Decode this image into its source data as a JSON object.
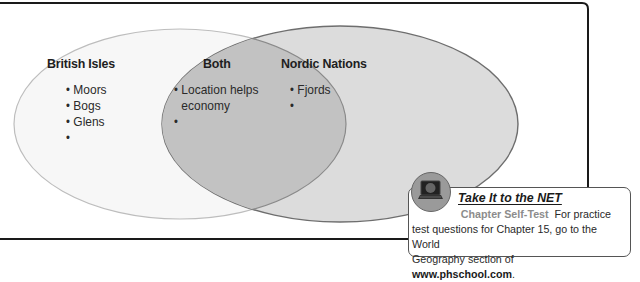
{
  "diagram": {
    "type": "venn",
    "circles": [
      {
        "id": "left",
        "heading": "British Isles",
        "items": [
          "Moors",
          "Bogs",
          "Glens",
          ""
        ],
        "fill": "#f7f7f7",
        "stroke": "#b8b8b8"
      },
      {
        "id": "right",
        "heading": "Nordic Nations",
        "items": [
          "Fjords",
          ""
        ],
        "fill": "#dcdcdc",
        "stroke": "#6e6e6e"
      }
    ],
    "overlap": {
      "heading": "Both",
      "items": [
        "Location helps economy",
        ""
      ],
      "item_lines": [
        "Location helps",
        "economy"
      ],
      "fill": "#c4c4c4"
    }
  },
  "net_callout": {
    "title": "Take It to the NET",
    "subtitle": "Chapter Self-Test",
    "text_line1": "For practice",
    "text_line2": "test questions for Chapter 15, go to the World",
    "text_line3_prefix": "Geography section of ",
    "url": "www.phschool.com",
    "text_line3_suffix": ".",
    "icon": "computer-monitor-icon"
  },
  "colors": {
    "frame": "#1a1a1a",
    "net_subtitle": "#8c8c8c"
  }
}
